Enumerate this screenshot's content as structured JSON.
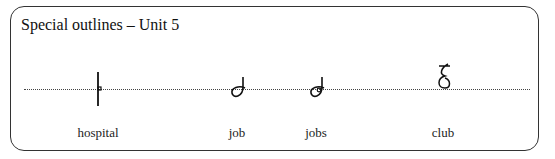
{
  "title": "Special outlines – Unit 5",
  "outlines": [
    {
      "word": "hospital",
      "x": 98
    },
    {
      "word": "job",
      "x": 237
    },
    {
      "word": "jobs",
      "x": 316
    },
    {
      "word": "club",
      "x": 443
    }
  ]
}
